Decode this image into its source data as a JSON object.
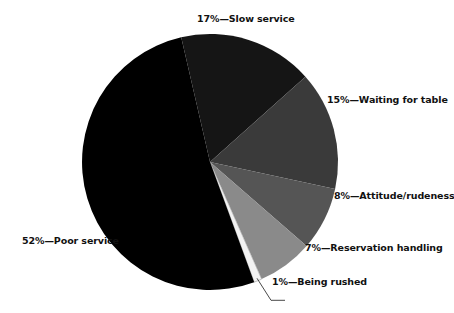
{
  "chart_data": {
    "type": "pie",
    "title": "",
    "subtitle": "",
    "xlabel": "",
    "ylabel": "",
    "legend_position": "none",
    "grid": false,
    "labels_inline": true,
    "units": "percent",
    "background_color": "#ffffff",
    "text_color": "#111111",
    "start_angle_deg": -103,
    "direction": "clockwise",
    "center": {
      "x": 210,
      "y": 162
    },
    "radius": 128,
    "categories": [
      "Slow service",
      "Waiting for table",
      "Attitude/rudeness",
      "Reservation handling",
      "Being rushed",
      "Poor service"
    ],
    "values": [
      17,
      15,
      8,
      7,
      1,
      52
    ],
    "colors": [
      "#151515",
      "#3a3a3a",
      "#555555",
      "#8a8a8a",
      "#f2f2f2",
      "#000000"
    ],
    "slices": [
      {
        "label": "Slow service",
        "value": 17,
        "percent_text": "17%",
        "callout": "17%—Slow service",
        "color": "#151515",
        "leader_line": false
      },
      {
        "label": "Waiting for table",
        "value": 15,
        "percent_text": "15%",
        "callout": "15%—Waiting for table",
        "color": "#3a3a3a",
        "leader_line": false
      },
      {
        "label": "Attitude/rudeness",
        "value": 8,
        "percent_text": "8%",
        "callout": "8%—Attitude/rudeness",
        "color": "#555555",
        "leader_line": false
      },
      {
        "label": "Reservation handling",
        "value": 7,
        "percent_text": "7%",
        "callout": "7%—Reservation handling",
        "color": "#8a8a8a",
        "leader_line": false
      },
      {
        "label": "Being rushed",
        "value": 1,
        "percent_text": "1%",
        "callout": "1%—Being rushed",
        "color": "#f2f2f2",
        "leader_line": true
      },
      {
        "label": "Poor service",
        "value": 52,
        "percent_text": "52%",
        "callout": "52%—Poor service",
        "color": "#000000",
        "leader_line": false
      }
    ]
  }
}
